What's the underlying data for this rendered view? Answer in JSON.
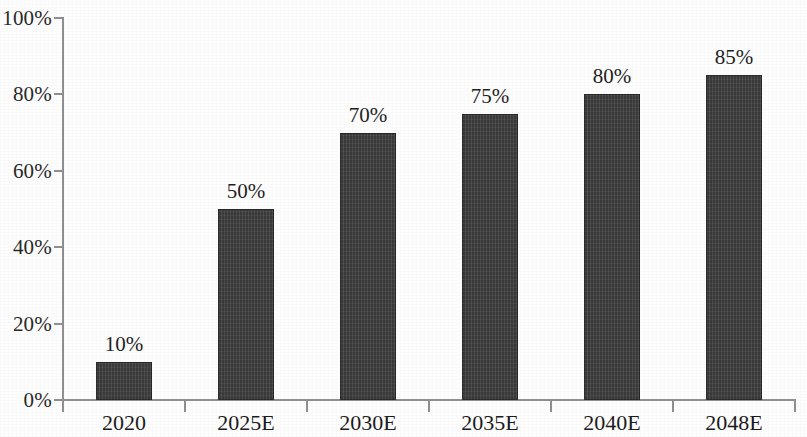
{
  "chart_data": {
    "type": "bar",
    "title": "",
    "subtitle": "",
    "xlabel": "",
    "ylabel": "",
    "categories": [
      "2020",
      "2025E",
      "2030E",
      "2035E",
      "2040E",
      "2048E"
    ],
    "values": [
      10,
      50,
      70,
      75,
      80,
      85
    ],
    "value_labels": [
      "10%",
      "50%",
      "70%",
      "75%",
      "80%",
      "85%"
    ],
    "ylim": [
      0,
      100
    ],
    "ytick_values": [
      0,
      20,
      40,
      60,
      80,
      100
    ],
    "ytick_labels": [
      "0%",
      "20%",
      "40%",
      "60%",
      "80%",
      "100%"
    ],
    "grid": false,
    "legend": null,
    "legend_position": "none",
    "series": [
      {
        "name": "",
        "values": [
          10,
          50,
          70,
          75,
          80,
          85
        ],
        "color": "#3a3a3a"
      }
    ],
    "annotations": []
  },
  "style": {
    "bar_color": "#3a3a3a",
    "axis_color": "#8f8f8f",
    "text_color": "#1f1f1f",
    "background": "#fdfdfd"
  }
}
